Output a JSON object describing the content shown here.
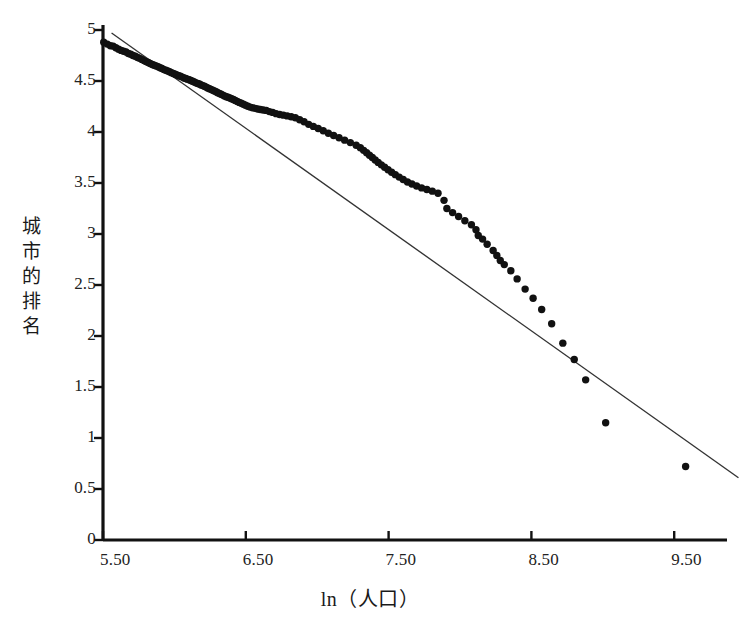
{
  "chart_data": {
    "type": "scatter",
    "title": "",
    "xlabel": "ln（人口）",
    "ylabel": "城市的排名",
    "ylabel_chars": [
      "城",
      "市",
      "的",
      "排",
      "名"
    ],
    "xlim": [
      5.5,
      9.99
    ],
    "ylim": [
      0,
      5
    ],
    "xticks": [
      5.5,
      6.5,
      7.5,
      8.5,
      9.5
    ],
    "xtick_labels": [
      "5.50",
      "6.50",
      "7.50",
      "8.50",
      "9.50"
    ],
    "yticks": [
      0,
      0.5,
      1,
      1.5,
      2,
      2.5,
      3,
      3.5,
      4,
      4.5,
      5
    ],
    "ytick_labels": [
      "0",
      "0.5",
      "1",
      "1.5",
      "2",
      "2.5",
      "3",
      "3.5",
      "4",
      "4.5",
      "5"
    ],
    "grid": false,
    "legend": null,
    "point_color": "#111111",
    "line_color": "#333333",
    "axis_color": "#111111",
    "marker_size": 5.0,
    "series": [
      {
        "name": "城市",
        "type": "scatter",
        "points": [
          [
            5.505,
            4.88
          ],
          [
            5.53,
            4.862
          ],
          [
            5.552,
            4.845
          ],
          [
            5.571,
            4.842
          ],
          [
            5.59,
            4.826
          ],
          [
            5.609,
            4.812
          ],
          [
            5.627,
            4.8
          ],
          [
            5.644,
            4.792
          ],
          [
            5.661,
            4.784
          ],
          [
            5.678,
            4.77
          ],
          [
            5.694,
            4.762
          ],
          [
            5.71,
            4.75
          ],
          [
            5.726,
            4.742
          ],
          [
            5.742,
            4.73
          ],
          [
            5.757,
            4.722
          ],
          [
            5.772,
            4.712
          ],
          [
            5.787,
            4.7
          ],
          [
            5.801,
            4.69
          ],
          [
            5.816,
            4.682
          ],
          [
            5.83,
            4.672
          ],
          [
            5.845,
            4.662
          ],
          [
            5.858,
            4.655
          ],
          [
            5.872,
            4.648
          ],
          [
            5.886,
            4.64
          ],
          [
            5.9,
            4.63
          ],
          [
            5.913,
            4.622
          ],
          [
            5.927,
            4.612
          ],
          [
            5.94,
            4.605
          ],
          [
            5.953,
            4.598
          ],
          [
            5.966,
            4.59
          ],
          [
            5.979,
            4.582
          ],
          [
            5.992,
            4.574
          ],
          [
            6.005,
            4.566
          ],
          [
            6.017,
            4.56
          ],
          [
            6.03,
            4.552
          ],
          [
            6.042,
            4.546
          ],
          [
            6.055,
            4.538
          ],
          [
            6.067,
            4.53
          ],
          [
            6.079,
            4.524
          ],
          [
            6.091,
            4.518
          ],
          [
            6.103,
            4.512
          ],
          [
            6.115,
            4.505
          ],
          [
            6.127,
            4.498
          ],
          [
            6.139,
            4.49
          ],
          [
            6.151,
            4.482
          ],
          [
            6.163,
            4.476
          ],
          [
            6.175,
            4.47
          ],
          [
            6.187,
            4.462
          ],
          [
            6.198,
            4.455
          ],
          [
            6.21,
            4.448
          ],
          [
            6.222,
            4.44
          ],
          [
            6.233,
            4.432
          ],
          [
            6.245,
            4.424
          ],
          [
            6.256,
            4.418
          ],
          [
            6.268,
            4.41
          ],
          [
            6.28,
            4.402
          ],
          [
            6.292,
            4.394
          ],
          [
            6.303,
            4.386
          ],
          [
            6.315,
            4.378
          ],
          [
            6.327,
            4.37
          ],
          [
            6.339,
            4.362
          ],
          [
            6.351,
            4.354
          ],
          [
            6.363,
            4.346
          ],
          [
            6.375,
            4.34
          ],
          [
            6.388,
            4.334
          ],
          [
            6.4,
            4.326
          ],
          [
            6.413,
            4.318
          ],
          [
            6.426,
            4.31
          ],
          [
            6.44,
            4.3
          ],
          [
            6.454,
            4.29
          ],
          [
            6.468,
            4.282
          ],
          [
            6.483,
            4.272
          ],
          [
            6.498,
            4.262
          ],
          [
            6.514,
            4.252
          ],
          [
            6.53,
            4.244
          ],
          [
            6.547,
            4.238
          ],
          [
            6.565,
            4.232
          ],
          [
            6.583,
            4.226
          ],
          [
            6.602,
            4.22
          ],
          [
            6.622,
            4.216
          ],
          [
            6.643,
            4.212
          ],
          [
            6.665,
            4.2
          ],
          [
            6.688,
            4.192
          ],
          [
            6.712,
            4.18
          ],
          [
            6.737,
            4.172
          ],
          [
            6.763,
            4.165
          ],
          [
            6.79,
            4.158
          ],
          [
            6.818,
            4.15
          ],
          [
            6.847,
            4.14
          ],
          [
            6.877,
            4.12
          ],
          [
            6.908,
            4.1
          ],
          [
            6.94,
            4.075
          ],
          [
            6.973,
            4.055
          ],
          [
            7.007,
            4.035
          ],
          [
            7.042,
            4.012
          ],
          [
            7.078,
            3.988
          ],
          [
            7.115,
            3.966
          ],
          [
            7.153,
            3.944
          ],
          [
            7.192,
            3.92
          ],
          [
            7.232,
            3.896
          ],
          [
            7.273,
            3.87
          ],
          [
            7.302,
            3.845
          ],
          [
            7.325,
            3.82
          ],
          [
            7.346,
            3.796
          ],
          [
            7.366,
            3.772
          ],
          [
            7.386,
            3.75
          ],
          [
            7.406,
            3.726
          ],
          [
            7.427,
            3.702
          ],
          [
            7.449,
            3.678
          ],
          [
            7.472,
            3.654
          ],
          [
            7.496,
            3.63
          ],
          [
            7.521,
            3.606
          ],
          [
            7.547,
            3.582
          ],
          [
            7.574,
            3.558
          ],
          [
            7.602,
            3.534
          ],
          [
            7.632,
            3.51
          ],
          [
            7.663,
            3.49
          ],
          [
            7.696,
            3.47
          ],
          [
            7.731,
            3.452
          ],
          [
            7.768,
            3.436
          ],
          [
            7.806,
            3.42
          ],
          [
            7.846,
            3.4
          ],
          [
            7.888,
            3.33
          ],
          [
            7.908,
            3.25
          ],
          [
            7.948,
            3.21
          ],
          [
            7.99,
            3.172
          ],
          [
            8.034,
            3.13
          ],
          [
            8.08,
            3.09
          ],
          [
            8.112,
            3.042
          ],
          [
            8.128,
            2.985
          ],
          [
            8.158,
            2.95
          ],
          [
            8.19,
            2.9
          ],
          [
            8.232,
            2.838
          ],
          [
            8.258,
            2.79
          ],
          [
            8.282,
            2.74
          ],
          [
            8.31,
            2.7
          ],
          [
            8.356,
            2.64
          ],
          [
            8.4,
            2.56
          ],
          [
            8.456,
            2.46
          ],
          [
            8.512,
            2.37
          ],
          [
            8.572,
            2.26
          ],
          [
            8.642,
            2.12
          ],
          [
            8.72,
            1.93
          ],
          [
            8.8,
            1.77
          ],
          [
            8.88,
            1.57
          ],
          [
            9.02,
            1.15
          ],
          [
            9.58,
            0.72
          ]
        ]
      }
    ],
    "fit_line": {
      "name": "拟合直线",
      "type": "line",
      "x0": 5.56,
      "y0": 4.97,
      "x1": 9.95,
      "y1": 0.61,
      "slope": -0.993,
      "intercept": 10.494
    }
  },
  "caption": ""
}
